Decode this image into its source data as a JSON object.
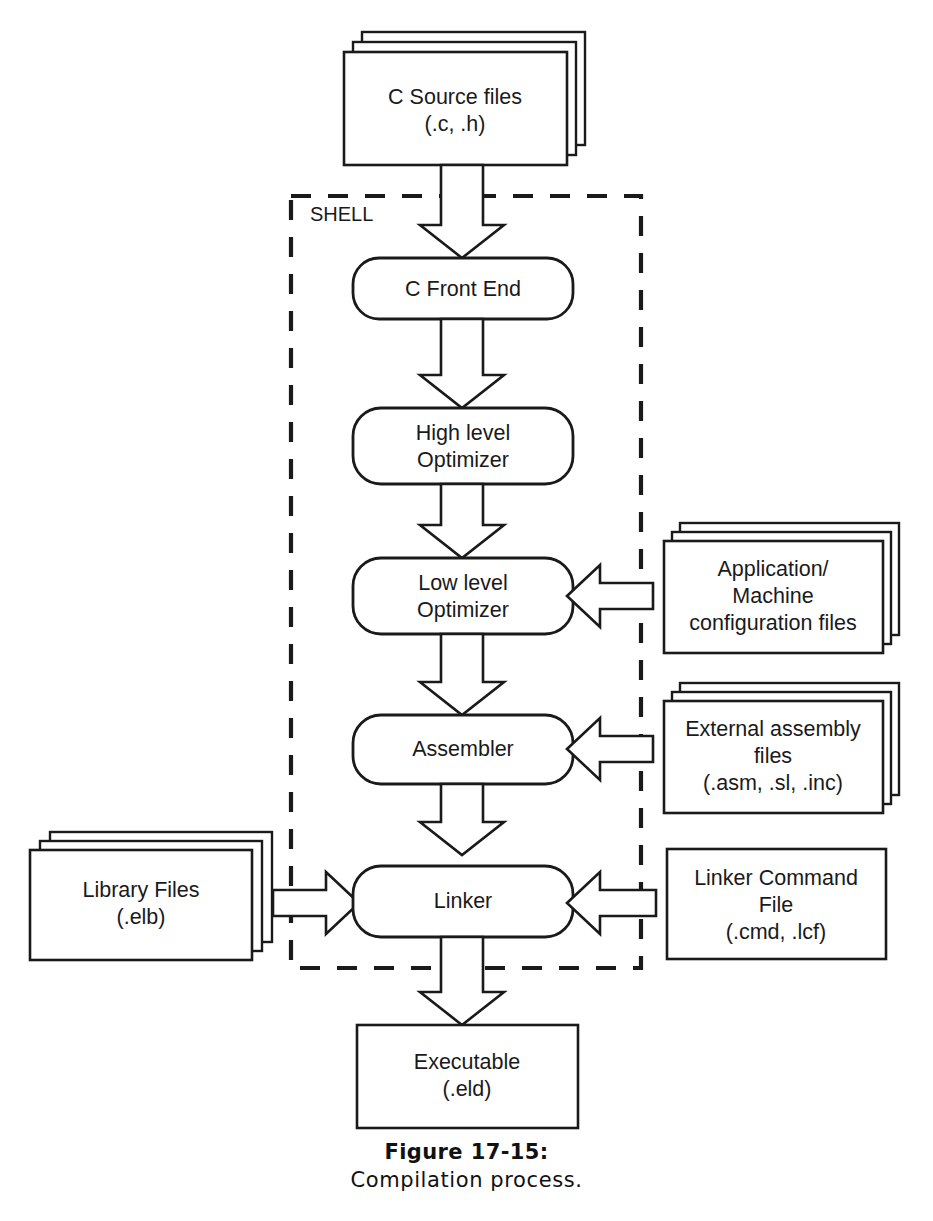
{
  "figure": {
    "caption_title": "Figure 17-15:",
    "caption_subtitle": "Compilation process.",
    "boundary_label": "SHELL",
    "ink_color": "#1a1a1a",
    "paper_color": "#ffffff"
  },
  "nodes": {
    "source_files": {
      "name": "C Source files",
      "line1": "C Source files",
      "line2": "(.c, .h)",
      "shape": "stacked-document",
      "sheets": 3
    },
    "c_front_end": {
      "name": "C Front End",
      "line1": "C Front End",
      "shape": "rounded-process"
    },
    "high_level_optimizer": {
      "name": "High level Optimizer",
      "line1": "High level",
      "line2": "Optimizer",
      "shape": "rounded-process"
    },
    "low_level_optimizer": {
      "name": "Low level Optimizer",
      "line1": "Low level",
      "line2": "Optimizer",
      "shape": "rounded-process"
    },
    "assembler": {
      "name": "Assembler",
      "line1": "Assembler",
      "shape": "rounded-process"
    },
    "linker": {
      "name": "Linker",
      "line1": "Linker",
      "shape": "rounded-process"
    },
    "config_files": {
      "name": "Application/Machine configuration files",
      "line1": "Application/",
      "line2": "Machine",
      "line3": "configuration files",
      "shape": "stacked-document",
      "sheets": 3
    },
    "external_assembly": {
      "name": "External assembly files",
      "line1": "External assembly",
      "line2": "files",
      "line3": "(.asm, .sl, .inc)",
      "shape": "stacked-document",
      "sheets": 3
    },
    "library_files": {
      "name": "Library Files",
      "line1": "Library Files",
      "line2": "(.elb)",
      "shape": "stacked-document",
      "sheets": 3
    },
    "linker_command_file": {
      "name": "Linker Command File",
      "line1": "Linker Command",
      "line2": "File",
      "line3": "(.cmd, .lcf)",
      "shape": "document"
    },
    "executable": {
      "name": "Executable",
      "line1": "Executable",
      "line2": "(.eld)",
      "shape": "document"
    }
  },
  "flow": {
    "edges": [
      {
        "from": "source_files",
        "to": "c_front_end",
        "direction": "down"
      },
      {
        "from": "c_front_end",
        "to": "high_level_optimizer",
        "direction": "down"
      },
      {
        "from": "high_level_optimizer",
        "to": "low_level_optimizer",
        "direction": "down"
      },
      {
        "from": "low_level_optimizer",
        "to": "assembler",
        "direction": "down"
      },
      {
        "from": "assembler",
        "to": "linker",
        "direction": "down"
      },
      {
        "from": "linker",
        "to": "executable",
        "direction": "down"
      },
      {
        "from": "config_files",
        "to": "low_level_optimizer",
        "direction": "left"
      },
      {
        "from": "external_assembly",
        "to": "assembler",
        "direction": "left"
      },
      {
        "from": "linker_command_file",
        "to": "linker",
        "direction": "left"
      },
      {
        "from": "library_files",
        "to": "linker",
        "direction": "right"
      }
    ]
  }
}
